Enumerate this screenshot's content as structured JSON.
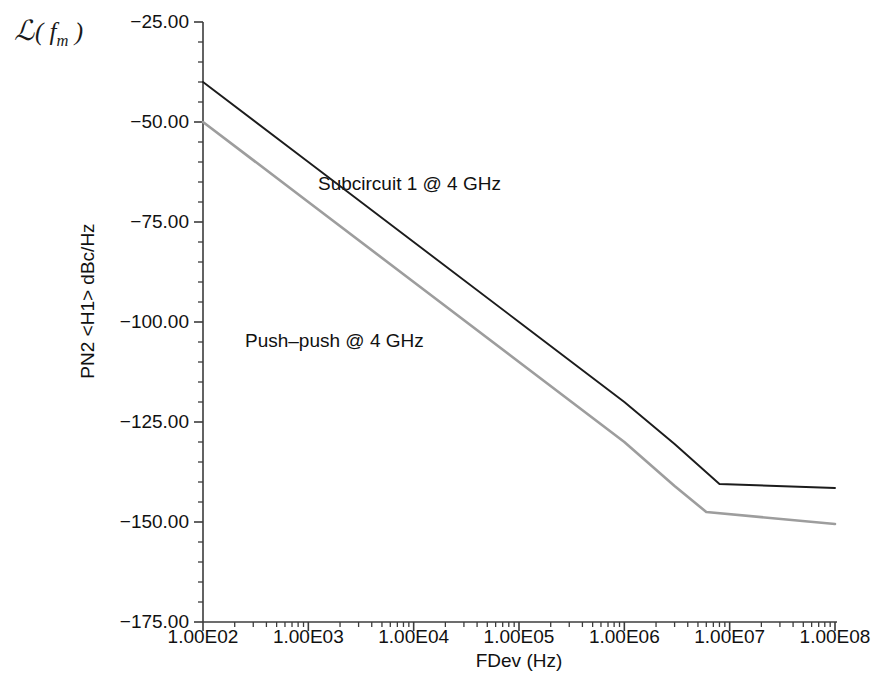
{
  "figure": {
    "corner_symbol_l": "ℒ",
    "corner_symbol_arg": "( f",
    "corner_symbol_sub": "m",
    "corner_symbol_close": " )",
    "background": "#ffffff"
  },
  "axes": {
    "y_title": "PN2 <H1> dBc/Hz",
    "x_title": "FDev (Hz)",
    "y_ticks": [
      "−25.00",
      "−50.00",
      "−75.00",
      "−100.00",
      "−125.00",
      "−150.00",
      "−175.00"
    ],
    "y_tick_values": [
      -25,
      -50,
      -75,
      -100,
      -125,
      -150,
      -175
    ],
    "x_ticks": [
      "1.00E02",
      "1.00E03",
      "1.00E04",
      "1.00E05",
      "1.00E06",
      "1.00E07",
      "1.00E08"
    ],
    "x_tick_values": [
      100,
      1000,
      10000,
      100000,
      1000000,
      10000000,
      100000000
    ],
    "axis_color": "#3c3c3c"
  },
  "annotations": [
    {
      "name": "subcircuit-label",
      "text": "Subcircuit 1 @ 4 GHz",
      "x": 318,
      "y": 173
    },
    {
      "name": "push-push-label",
      "text": "Push–push @ 4 GHz",
      "x": 245,
      "y": 330
    }
  ],
  "chart_data": {
    "type": "line",
    "title": "",
    "xlabel": "FDev (Hz)",
    "ylabel": "PN2 <H1> dBc/Hz",
    "xscale": "log",
    "yscale": "linear",
    "xlim": [
      100,
      100000000
    ],
    "ylim": [
      -175,
      -25
    ],
    "grid": false,
    "legend": "annotations-in-plot",
    "series": [
      {
        "name": "Subcircuit 1 @ 4 GHz",
        "color": "#1c1c1c",
        "width": 1.9,
        "x": [
          100,
          1000,
          10000,
          100000,
          1000000,
          3000000,
          8000000,
          100000000
        ],
        "y": [
          -40.0,
          -60.0,
          -80.0,
          -100.0,
          -120.0,
          -130.5,
          -140.5,
          -141.5
        ]
      },
      {
        "name": "Push–push @ 4 GHz",
        "color": "#9d9d9d",
        "width": 2.6,
        "x": [
          100,
          1000,
          10000,
          100000,
          1000000,
          3000000,
          6000000,
          100000000
        ],
        "y": [
          -50.0,
          -70.0,
          -90.0,
          -110.0,
          -130.0,
          -141.0,
          -147.5,
          -150.5
        ]
      }
    ]
  },
  "geometry": {
    "plot_left": 203,
    "plot_right": 835,
    "plot_top": 22,
    "plot_bottom": 622
  }
}
